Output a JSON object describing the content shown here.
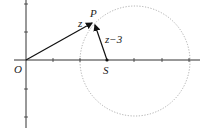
{
  "diagram": {
    "labels": {
      "origin": "O",
      "point_p": "P",
      "point_s": "S",
      "vector_z": "z",
      "vector_z_minus_3": "z−3"
    },
    "colors": {
      "axis": "#333333",
      "vector": "#111111",
      "circle": "#999999"
    }
  }
}
